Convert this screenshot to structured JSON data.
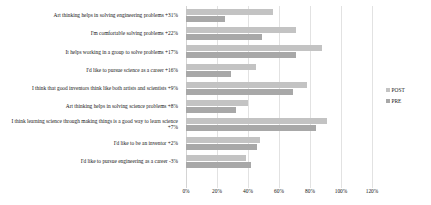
{
  "chart_data": {
    "type": "bar",
    "orientation": "horizontal",
    "title": "",
    "xlabel": "",
    "ylabel": "",
    "xlim": [
      0,
      120
    ],
    "grid": true,
    "legend_position": "right",
    "xticks": [
      "0%",
      "20%",
      "40%",
      "60%",
      "80%",
      "100%",
      "120%"
    ],
    "xtick_values": [
      0,
      20,
      40,
      60,
      80,
      100,
      120
    ],
    "categories": [
      "Art thinking helps in solving engineering problems +31%",
      "I'm comfortable solving problems +22%",
      "It helps working in a group to solve problems +17%",
      "I'd like to pursue science as a career +16%",
      "I think that good inventors think like both artists and scientists +9%",
      "Art thinking helps in solving science problems +8%",
      "I think learning science through making things is a good way to learn science +7%",
      "I'd like to be an inventor +2%",
      "I'd like to pursue engineering as a career -3%"
    ],
    "deltas": [
      31,
      22,
      17,
      16,
      9,
      8,
      7,
      2,
      -3
    ],
    "series": [
      {
        "name": "POST",
        "color": "#c3c3c3",
        "values": [
          56,
          71,
          88,
          45,
          78,
          40,
          91,
          48,
          39
        ]
      },
      {
        "name": "PRE",
        "color": "#a8a8a8",
        "values": [
          25,
          49,
          71,
          29,
          69,
          32,
          84,
          46,
          42
        ]
      }
    ]
  },
  "legend": {
    "items": [
      {
        "label": "POST",
        "color": "#c3c3c3"
      },
      {
        "label": "PRE",
        "color": "#a8a8a8"
      }
    ]
  }
}
